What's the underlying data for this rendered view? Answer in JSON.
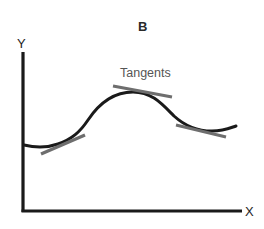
{
  "diagram": {
    "title": "B",
    "axes": {
      "y_label": "Y",
      "x_label": "X"
    },
    "annotation": "Tangents",
    "elements": {
      "curve": "smooth wave curve: slight dip, rises to a peak, descends to a trough, slight rise at end",
      "tangent_lines": [
        {
          "position": "rising slope (left)"
        },
        {
          "position": "peak (top)"
        },
        {
          "position": "descending slope near trough (right)"
        }
      ]
    },
    "colors": {
      "curve": "#1a1a1a",
      "axes": "#1a1a1a",
      "tangents": "#6e6e6e",
      "annotation_text": "#555555",
      "background": "#ffffff"
    }
  }
}
